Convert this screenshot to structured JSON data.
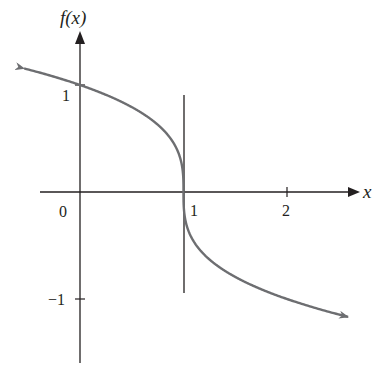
{
  "chart_data": {
    "type": "line",
    "title": "",
    "function": "f(x) = cube root of (1 - x)",
    "xlabel": "x",
    "ylabel": "f(x)",
    "x_ticks": [
      {
        "value": 0,
        "label": "0"
      },
      {
        "value": 1,
        "label": "1"
      },
      {
        "value": 2,
        "label": "2"
      }
    ],
    "y_ticks": [
      {
        "value": 1,
        "label": "1"
      },
      {
        "value": -1,
        "label": "−1"
      }
    ],
    "xlim": [
      -0.55,
      2.7
    ],
    "ylim": [
      -1.6,
      1.5
    ],
    "grid": false,
    "legend": null,
    "vertical_tangent_line": {
      "x": 1,
      "y_range": [
        -0.95,
        0.9
      ]
    },
    "series": [
      {
        "name": "f(x)",
        "color": "#6d6e71",
        "arrows": "both ends",
        "x": [
          -0.54,
          -0.25,
          0,
          0.25,
          0.5,
          0.75,
          0.9,
          0.97,
          1,
          1.03,
          1.1,
          1.25,
          1.5,
          1.75,
          2,
          2.25,
          2.59
        ],
        "values": [
          1.155,
          1.077,
          1.0,
          0.909,
          0.794,
          0.63,
          0.464,
          0.311,
          0,
          -0.311,
          -0.464,
          -0.63,
          -0.794,
          -0.909,
          -1.0,
          -1.077,
          -1.17
        ]
      }
    ]
  },
  "labels": {
    "y_axis": "f(x)",
    "x_axis": "x",
    "origin": "0",
    "x1": "1",
    "x2": "2",
    "y1": "1",
    "yneg1": "−1"
  },
  "colors": {
    "axis": "#231f20",
    "curve": "#6d6e71"
  }
}
